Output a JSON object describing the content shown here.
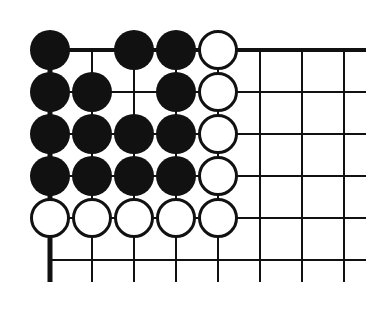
{
  "diagram": {
    "type": "go-board-corner",
    "grid": {
      "columns": 8,
      "rows": 6,
      "origin_x": 50,
      "origin_y": 50,
      "spacing": 42,
      "right_edge_x": 366,
      "bottom_edge_y": 282,
      "top_edge_bold": true,
      "left_edge_bold": true
    },
    "colors": {
      "black_stone": "#111111",
      "white_stone": "#ffffff",
      "line": "#111111",
      "background": "#ffffff"
    },
    "stones": [
      {
        "color": "black",
        "col": 0,
        "row": 0
      },
      {
        "color": "black",
        "col": 2,
        "row": 0
      },
      {
        "color": "black",
        "col": 3,
        "row": 0
      },
      {
        "color": "white",
        "col": 4,
        "row": 0
      },
      {
        "color": "black",
        "col": 0,
        "row": 1
      },
      {
        "color": "black",
        "col": 1,
        "row": 1
      },
      {
        "color": "black",
        "col": 3,
        "row": 1
      },
      {
        "color": "white",
        "col": 4,
        "row": 1
      },
      {
        "color": "black",
        "col": 0,
        "row": 2
      },
      {
        "color": "black",
        "col": 1,
        "row": 2
      },
      {
        "color": "black",
        "col": 2,
        "row": 2
      },
      {
        "color": "black",
        "col": 3,
        "row": 2
      },
      {
        "color": "white",
        "col": 4,
        "row": 2
      },
      {
        "color": "black",
        "col": 0,
        "row": 3
      },
      {
        "color": "black",
        "col": 1,
        "row": 3
      },
      {
        "color": "black",
        "col": 2,
        "row": 3
      },
      {
        "color": "black",
        "col": 3,
        "row": 3
      },
      {
        "color": "white",
        "col": 4,
        "row": 3
      },
      {
        "color": "white",
        "col": 0,
        "row": 4
      },
      {
        "color": "white",
        "col": 1,
        "row": 4
      },
      {
        "color": "white",
        "col": 2,
        "row": 4
      },
      {
        "color": "white",
        "col": 3,
        "row": 4
      },
      {
        "color": "white",
        "col": 4,
        "row": 4
      }
    ]
  }
}
